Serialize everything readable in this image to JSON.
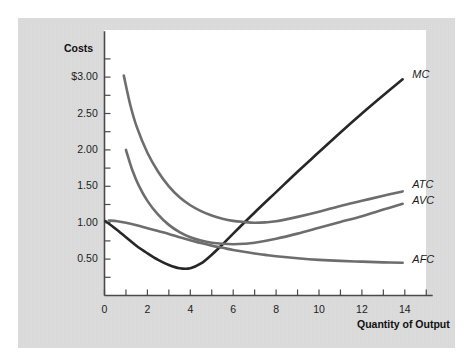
{
  "figure": {
    "background_color": "#ffffff",
    "panel_color": "#dddddd",
    "plot_color": "#ffffff"
  },
  "chart_data": {
    "type": "line",
    "title": "",
    "ylabel": "Costs",
    "xlabel": "Quantity of Output",
    "xlim": [
      0,
      15.3
    ],
    "ylim": [
      0,
      3.63
    ],
    "grid": false,
    "legend_position": "right-of-curve-ends",
    "xticks": [
      0,
      1,
      2,
      3,
      4,
      5,
      6,
      7,
      8,
      9,
      10,
      11,
      12,
      13,
      14,
      15
    ],
    "xticklabels": [
      "0",
      "",
      "2",
      "",
      "4",
      "",
      "6",
      "",
      "8",
      "",
      "10",
      "",
      "12",
      "",
      "14",
      ""
    ],
    "yticks": [
      0.25,
      0.5,
      0.75,
      1.0,
      1.25,
      1.5,
      1.75,
      2.0,
      2.25,
      2.5,
      2.75,
      3.0,
      3.25
    ],
    "yticklabels": [
      "",
      "0.50",
      "",
      "1.00",
      "",
      "1.50",
      "",
      "2.00",
      "",
      "2.50",
      "",
      "$3.00",
      ""
    ],
    "axis_color": "#4a4a4a",
    "series": [
      {
        "name": "MC",
        "label": "MC",
        "color": "#272727",
        "width": 2.6,
        "points": [
          [
            0.05,
            1.02
          ],
          [
            0.5,
            0.92
          ],
          [
            1.0,
            0.8
          ],
          [
            1.5,
            0.68
          ],
          [
            2.0,
            0.58
          ],
          [
            2.5,
            0.49
          ],
          [
            3.0,
            0.42
          ],
          [
            3.5,
            0.375
          ],
          [
            4.0,
            0.375
          ],
          [
            4.5,
            0.44
          ],
          [
            5.0,
            0.56
          ],
          [
            5.5,
            0.7
          ],
          [
            6.0,
            0.85
          ],
          [
            7.0,
            1.14
          ],
          [
            8.0,
            1.42
          ],
          [
            9.0,
            1.7
          ],
          [
            10.0,
            1.97
          ],
          [
            11.0,
            2.24
          ],
          [
            12.0,
            2.5
          ],
          [
            13.0,
            2.75
          ],
          [
            13.9,
            2.97
          ]
        ]
      },
      {
        "name": "ATC",
        "label": "ATC",
        "color": "#6d6d6d",
        "width": 2.6,
        "points": [
          [
            0.9,
            3.02
          ],
          [
            1.2,
            2.62
          ],
          [
            1.5,
            2.32
          ],
          [
            2.0,
            1.96
          ],
          [
            2.5,
            1.7
          ],
          [
            3.0,
            1.5
          ],
          [
            3.5,
            1.35
          ],
          [
            4.0,
            1.24
          ],
          [
            4.5,
            1.16
          ],
          [
            5.0,
            1.1
          ],
          [
            5.5,
            1.055
          ],
          [
            6.0,
            1.025
          ],
          [
            6.5,
            1.01
          ],
          [
            7.0,
            1.0
          ],
          [
            7.5,
            1.005
          ],
          [
            8.0,
            1.02
          ],
          [
            9.0,
            1.08
          ],
          [
            10.0,
            1.15
          ],
          [
            11.0,
            1.23
          ],
          [
            12.0,
            1.3
          ],
          [
            13.0,
            1.37
          ],
          [
            13.9,
            1.43
          ]
        ]
      },
      {
        "name": "AVC",
        "label": "AVC",
        "color": "#6d6d6d",
        "width": 2.6,
        "points": [
          [
            1.0,
            2.0
          ],
          [
            1.3,
            1.72
          ],
          [
            1.6,
            1.51
          ],
          [
            2.0,
            1.3
          ],
          [
            2.5,
            1.11
          ],
          [
            3.0,
            0.97
          ],
          [
            3.5,
            0.87
          ],
          [
            4.0,
            0.8
          ],
          [
            4.5,
            0.755
          ],
          [
            5.0,
            0.725
          ],
          [
            5.5,
            0.71
          ],
          [
            6.0,
            0.705
          ],
          [
            6.5,
            0.71
          ],
          [
            7.0,
            0.725
          ],
          [
            8.0,
            0.78
          ],
          [
            9.0,
            0.85
          ],
          [
            10.0,
            0.93
          ],
          [
            11.0,
            1.01
          ],
          [
            12.0,
            1.09
          ],
          [
            13.0,
            1.18
          ],
          [
            13.9,
            1.26
          ]
        ]
      },
      {
        "name": "AFC",
        "label": "AFC",
        "color": "#6d6d6d",
        "width": 2.6,
        "points": [
          [
            0.2,
            1.03
          ],
          [
            0.6,
            1.02
          ],
          [
            1.0,
            1.0
          ],
          [
            1.5,
            0.965
          ],
          [
            2.0,
            0.925
          ],
          [
            2.5,
            0.885
          ],
          [
            3.0,
            0.845
          ],
          [
            3.5,
            0.8
          ],
          [
            4.0,
            0.76
          ],
          [
            4.5,
            0.72
          ],
          [
            5.0,
            0.685
          ],
          [
            5.5,
            0.655
          ],
          [
            6.0,
            0.625
          ],
          [
            6.5,
            0.6
          ],
          [
            7.0,
            0.578
          ],
          [
            7.5,
            0.558
          ],
          [
            8.0,
            0.54
          ],
          [
            9.0,
            0.512
          ],
          [
            10.0,
            0.49
          ],
          [
            11.0,
            0.475
          ],
          [
            12.0,
            0.465
          ],
          [
            13.0,
            0.455
          ],
          [
            13.9,
            0.45
          ]
        ]
      }
    ],
    "annotations": [
      {
        "name": "mc-label",
        "text": "MC",
        "x": 14.35,
        "y": 3.02
      },
      {
        "name": "atc-label",
        "text": "ATC",
        "x": 14.35,
        "y": 1.5
      },
      {
        "name": "avc-label",
        "text": "AVC",
        "x": 14.35,
        "y": 1.29
      },
      {
        "name": "afc-label",
        "text": "AFC",
        "x": 14.35,
        "y": 0.48
      }
    ]
  },
  "axis_titles": {
    "y": "Costs",
    "x": "Quantity of Output"
  },
  "tick_labels": {
    "y": [
      "$3.00",
      "2.50",
      "2.00",
      "1.50",
      "1.00",
      "0.50"
    ],
    "x": [
      "0",
      "2",
      "4",
      "6",
      "8",
      "10",
      "12",
      "14"
    ]
  }
}
